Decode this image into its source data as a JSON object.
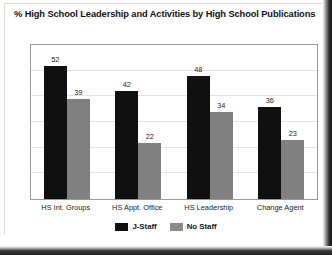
{
  "chart_data": {
    "type": "bar",
    "title": "% High School Leadership and Activities by High School Publications",
    "xlabel": "",
    "ylabel": "",
    "ylim": [
      0,
      60
    ],
    "yticks": [
      0,
      10,
      20,
      30,
      40,
      50,
      60
    ],
    "grid": true,
    "legend_position": "bottom",
    "categories": [
      "HS Int. Groups",
      "HS Appt. Office",
      "HS Leadership",
      "Change Agent"
    ],
    "series": [
      {
        "name": "J-Staff",
        "color": "#101010",
        "values": [
          52,
          42,
          48,
          36
        ]
      },
      {
        "name": "No Staff",
        "color": "#808080",
        "values": [
          39,
          22,
          34,
          23
        ]
      }
    ]
  }
}
